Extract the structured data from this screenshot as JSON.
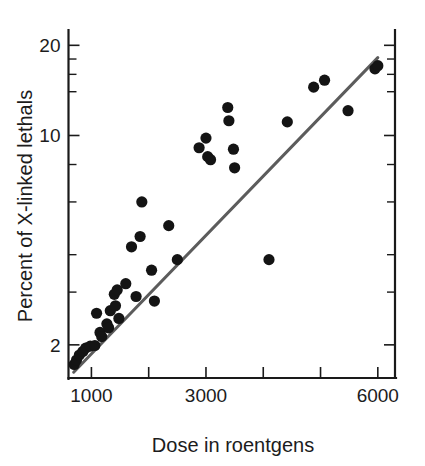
{
  "chart_data": {
    "type": "scatter",
    "title": "",
    "xlabel": "Dose in roentgens",
    "ylabel": "Percent of X-linked lethals",
    "xscale": "linear",
    "yscale": "log",
    "xlim": [
      600,
      6300
    ],
    "ylim": [
      1.55,
      22.5
    ],
    "grid": false,
    "legend": null,
    "xticks": [
      {
        "value": 1000,
        "label": "1000",
        "major": true
      },
      {
        "value": 2000,
        "label": "",
        "major": false
      },
      {
        "value": 3000,
        "label": "3000",
        "major": true
      },
      {
        "value": 4000,
        "label": "",
        "major": false
      },
      {
        "value": 5000,
        "label": "",
        "major": false
      },
      {
        "value": 6000,
        "label": "6000",
        "major": true
      }
    ],
    "yticks": [
      {
        "value": 20,
        "label": "20",
        "major": true
      },
      {
        "value": 18,
        "label": "",
        "major": false
      },
      {
        "value": 16,
        "label": "",
        "major": false
      },
      {
        "value": 14,
        "label": "",
        "major": false
      },
      {
        "value": 10,
        "label": "10",
        "major": true
      },
      {
        "value": 8,
        "label": "",
        "major": false
      },
      {
        "value": 6,
        "label": "",
        "major": false
      },
      {
        "value": 4,
        "label": "",
        "major": false
      },
      {
        "value": 3,
        "label": "",
        "major": false
      },
      {
        "value": 2,
        "label": "2",
        "major": true
      }
    ],
    "series": [
      {
        "name": "X-linked lethals vs dose",
        "marker": "circle",
        "color": "#141414",
        "points": [
          {
            "x": 700,
            "y": 1.72
          },
          {
            "x": 740,
            "y": 1.78
          },
          {
            "x": 790,
            "y": 1.85
          },
          {
            "x": 850,
            "y": 1.9
          },
          {
            "x": 900,
            "y": 1.95
          },
          {
            "x": 980,
            "y": 1.98
          },
          {
            "x": 1060,
            "y": 1.99
          },
          {
            "x": 1090,
            "y": 2.55
          },
          {
            "x": 1150,
            "y": 2.2
          },
          {
            "x": 1180,
            "y": 2.13
          },
          {
            "x": 1270,
            "y": 2.35
          },
          {
            "x": 1300,
            "y": 2.28
          },
          {
            "x": 1330,
            "y": 2.6
          },
          {
            "x": 1400,
            "y": 2.95
          },
          {
            "x": 1420,
            "y": 2.7
          },
          {
            "x": 1450,
            "y": 3.05
          },
          {
            "x": 1480,
            "y": 2.45
          },
          {
            "x": 1600,
            "y": 3.2
          },
          {
            "x": 1700,
            "y": 4.25
          },
          {
            "x": 1780,
            "y": 2.9
          },
          {
            "x": 1850,
            "y": 4.6
          },
          {
            "x": 1880,
            "y": 6.0
          },
          {
            "x": 2050,
            "y": 3.55
          },
          {
            "x": 2100,
            "y": 2.8
          },
          {
            "x": 2350,
            "y": 5.0
          },
          {
            "x": 2500,
            "y": 3.85
          },
          {
            "x": 2880,
            "y": 9.1
          },
          {
            "x": 3000,
            "y": 9.8
          },
          {
            "x": 3030,
            "y": 8.5
          },
          {
            "x": 3080,
            "y": 8.3
          },
          {
            "x": 3380,
            "y": 12.4
          },
          {
            "x": 3400,
            "y": 11.2
          },
          {
            "x": 3480,
            "y": 9.0
          },
          {
            "x": 3500,
            "y": 7.8
          },
          {
            "x": 4100,
            "y": 3.85
          },
          {
            "x": 4420,
            "y": 11.1
          },
          {
            "x": 4880,
            "y": 14.5
          },
          {
            "x": 5070,
            "y": 15.3
          },
          {
            "x": 5480,
            "y": 12.1
          },
          {
            "x": 5950,
            "y": 16.7
          },
          {
            "x": 6000,
            "y": 17.1
          }
        ]
      }
    ],
    "fit_line": {
      "name": "regression line",
      "color": "#5c5c5c",
      "x0": 690,
      "y0": 1.62,
      "x1": 6000,
      "y1": 18.2
    }
  }
}
